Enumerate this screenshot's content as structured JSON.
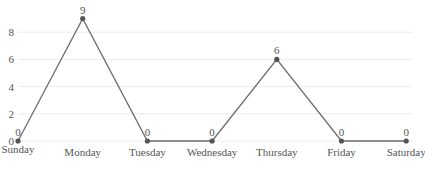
{
  "chart_data": {
    "type": "line",
    "title": "",
    "xlabel": "",
    "ylabel": "",
    "categories": [
      "Sunday",
      "Monday",
      "Tuesday",
      "Wednesday",
      "Thursday",
      "Friday",
      "Saturday"
    ],
    "series": [
      {
        "name": "",
        "values": [
          0,
          9,
          0,
          0,
          6,
          0,
          0
        ]
      }
    ],
    "y_ticks": [
      0,
      2,
      4,
      6,
      8
    ],
    "ylim": [
      0,
      9
    ],
    "grid": true,
    "legend": "none",
    "data_labels": true,
    "colors": {
      "line": "#6e6e6e",
      "point": "#555555",
      "grid": "#ececec",
      "text": "#555555"
    }
  }
}
